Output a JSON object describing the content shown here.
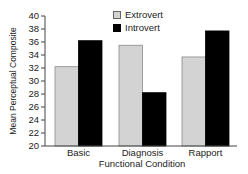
{
  "chart_data": {
    "type": "bar",
    "title": "",
    "xlabel": "Functional Condition",
    "ylabel": "Mean Perceptual Composite",
    "categories": [
      "Basic",
      "Diagnosis",
      "Rapport"
    ],
    "series": [
      {
        "name": "Extrovert",
        "color": "#d3d3d3",
        "values": [
          32.2,
          35.5,
          33.7
        ]
      },
      {
        "name": "Introvert",
        "color": "#000000",
        "values": [
          36.2,
          28.2,
          37.7
        ]
      }
    ],
    "ylim": [
      20,
      40
    ],
    "yticks": [
      20,
      22,
      24,
      26,
      28,
      30,
      32,
      34,
      36,
      38,
      40
    ],
    "grid": false,
    "legend_position": "top-right"
  },
  "legend": {
    "items": [
      {
        "label": "Extrovert",
        "color": "#d3d3d3"
      },
      {
        "label": "Introvert",
        "color": "#000000"
      }
    ]
  }
}
